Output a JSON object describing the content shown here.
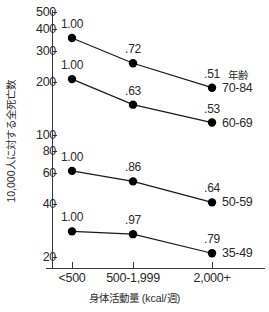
{
  "chart_data": {
    "type": "line",
    "title": "",
    "xlabel": "身体活動量 (kcal/週)",
    "ylabel": "10,000人に対する全死亡数",
    "categories": [
      "<500",
      "500-1,999",
      "2,000+"
    ],
    "yscale": "log",
    "ylim": [
      18,
      520
    ],
    "yticks": [
      500,
      400,
      300,
      200,
      100,
      80,
      60,
      40,
      20
    ],
    "ytick_labels": [
      "500",
      "400",
      "300",
      "200",
      "100",
      "80",
      "60",
      "40",
      "20"
    ],
    "grid": false,
    "legend_position": "right",
    "legend_title": "年齢",
    "series": [
      {
        "name": "70-84",
        "values": [
          355,
          255,
          185
        ],
        "point_labels": [
          "1.00",
          ".72",
          ".51"
        ]
      },
      {
        "name": "60-69",
        "values": [
          207,
          148,
          117
        ],
        "point_labels": [
          "1.00",
          ".63",
          ".53"
        ]
      },
      {
        "name": "50-59",
        "values": [
          62,
          54,
          41
        ],
        "point_labels": [
          "1.00",
          ".86",
          ".64"
        ]
      },
      {
        "name": "35-49",
        "values": [
          28,
          27,
          21
        ],
        "point_labels": [
          "1.00",
          ".97",
          ".79"
        ]
      }
    ],
    "colors": {
      "marker": "#000000",
      "line": "#1a1a1a",
      "axis": "#3a3a3a",
      "text": "#2b2b2b"
    }
  }
}
